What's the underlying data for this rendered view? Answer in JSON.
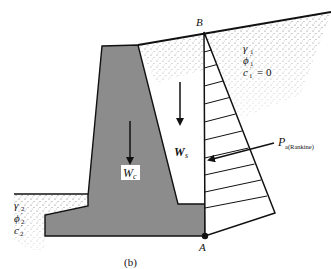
{
  "figure": {
    "caption": "(b)"
  },
  "points": {
    "top": "B",
    "bottom": "A"
  },
  "backfill_soil": {
    "gamma": "γ",
    "gamma_sub": "1",
    "phi": "ϕ",
    "phi_sub": "1",
    "phi_prime": "′",
    "c": "c",
    "c_sub": "1",
    "c_prime": "′",
    "c_value": "= 0"
  },
  "foundation_soil": {
    "gamma": "γ",
    "gamma_sub": "2",
    "phi": "ϕ",
    "phi_sub": "2",
    "phi_prime": "′",
    "c": "c",
    "c_sub": "2",
    "c_prime": "′"
  },
  "forces": {
    "concrete_weight": {
      "symbol": "W",
      "sub": "c"
    },
    "soil_weight": {
      "symbol": "W",
      "sub": "s"
    },
    "active_pressure": {
      "symbol": "P",
      "sub": "a(Rankine)"
    }
  },
  "colors": {
    "concrete": "#8c8c8c",
    "outline": "#111111",
    "soil_dots": "#555555",
    "background": "#ffffff"
  }
}
